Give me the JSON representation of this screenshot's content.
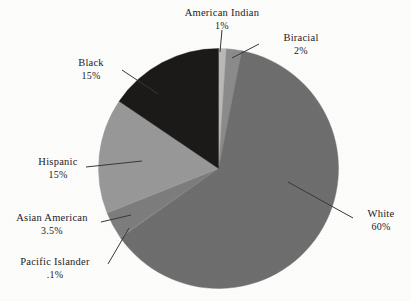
{
  "chart_data": {
    "type": "pie",
    "title": "",
    "subtitle": "",
    "xlabel": "",
    "ylabel": "",
    "legend_position": "none",
    "grid": false,
    "labels_outside": true,
    "categories": [
      "American Indian",
      "Biracial",
      "White",
      "Pacific Islander",
      "Asian American",
      "Hispanic",
      "Black"
    ],
    "values": [
      1,
      2,
      60,
      0.1,
      3.5,
      15,
      15
    ],
    "value_labels": [
      "1%",
      "2%",
      "60%",
      ".1%",
      "3.5%",
      "15%",
      "15%"
    ],
    "colors": [
      "#b9b9b9",
      "#8b8b8b",
      "#6e6e6e",
      "#7f7f7f",
      "#7d7d7d",
      "#989898",
      "#1b1a18"
    ],
    "slices": [
      {
        "name": "American Indian",
        "value": 1,
        "value_label": "1%",
        "color": "#b9b9b9"
      },
      {
        "name": "Biracial",
        "value": 2,
        "value_label": "2%",
        "color": "#8b8b8b"
      },
      {
        "name": "White",
        "value": 60,
        "value_label": "60%",
        "color": "#6e6e6e"
      },
      {
        "name": "Pacific Islander",
        "value": 0.1,
        "value_label": ".1%",
        "color": "#7f7f7f"
      },
      {
        "name": "Asian American",
        "value": 3.5,
        "value_label": "3.5%",
        "color": "#7d7d7d"
      },
      {
        "name": "Hispanic",
        "value": 15,
        "value_label": "15%",
        "color": "#989898"
      },
      {
        "name": "Black",
        "value": 15,
        "value_label": "15%",
        "color": "#1b1a18"
      }
    ]
  },
  "labels": {
    "american_indian": {
      "name": "American Indian",
      "pct": "1%"
    },
    "biracial": {
      "name": "Biracial",
      "pct": "2%"
    },
    "black": {
      "name": "Black",
      "pct": "15%"
    },
    "hispanic": {
      "name": "Hispanic",
      "pct": "15%"
    },
    "asian_american": {
      "name": "Asian American",
      "pct": "3.5%"
    },
    "pacific_islander": {
      "name": "Pacific Islander",
      "pct": ".1%"
    },
    "white": {
      "name": "White",
      "pct": "60%"
    }
  },
  "style": {
    "background": "#fdfdfc",
    "text_color": "#23211f",
    "leader_line_color": "#3a3836"
  }
}
